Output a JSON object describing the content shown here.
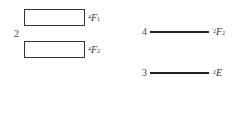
{
  "diagram": {
    "group_left": {
      "index": "2",
      "levels": [
        {
          "spin": "4",
          "term": "F",
          "sub": "1"
        },
        {
          "spin": "4",
          "term": "F",
          "sub": "2"
        }
      ]
    },
    "group_right": {
      "levels": [
        {
          "index": "4",
          "spin": "2",
          "term": "F",
          "sub": "2"
        },
        {
          "index": "3",
          "spin": "2",
          "term": "E",
          "sub": ""
        }
      ]
    }
  }
}
